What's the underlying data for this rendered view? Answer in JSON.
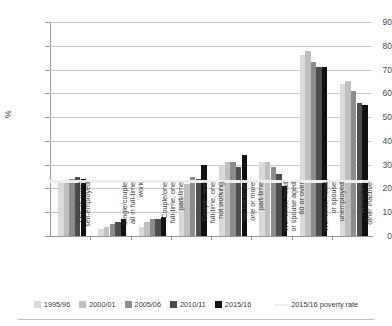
{
  "chart_data": {
    "type": "bar",
    "title": "",
    "subtitle": "",
    "xlabel": "",
    "ylabel": "%",
    "ylim": [
      0,
      90
    ],
    "yticks": [
      0,
      10,
      20,
      30,
      40,
      50,
      60,
      70,
      80,
      90
    ],
    "grid": true,
    "legend_position": "bottom",
    "categories": [
      "One or more\nself-employed",
      "Single/couple\nall in full-time\nwork",
      "Couple/one\nfull-time, one\npart-time",
      "Couple, one\nfull-time, one\nnot working",
      "No full-time,\none or more\npart-time",
      "Workless, head\nor spouse aged\n60 or over",
      "Workless, head\nor spouse\nunemployed",
      "Workless,\nother inactive"
    ],
    "series": [
      {
        "name": "1995/96",
        "color": "#d9d9d9",
        "values": [
          23,
          3,
          4,
          17,
          30,
          31,
          76,
          64
        ]
      },
      {
        "name": "2000/01",
        "color": "#bfbfbf",
        "values": [
          23,
          4,
          6,
          22,
          31,
          31,
          78,
          65
        ]
      },
      {
        "name": "2005/06",
        "color": "#8c8c8c",
        "values": [
          24,
          5,
          7,
          25,
          31,
          29,
          73,
          61
        ]
      },
      {
        "name": "2010/11",
        "color": "#4d4d4d",
        "values": [
          25,
          6,
          7,
          24,
          29,
          26,
          71,
          56
        ]
      },
      {
        "name": "2015/16",
        "color": "#111111",
        "values": [
          24,
          7,
          8,
          30,
          34,
          21,
          71,
          55
        ]
      }
    ],
    "reference_line": {
      "label": "2015/16 poverty rate",
      "value": 23,
      "color": "#eeeeee"
    }
  },
  "legend": {
    "items": [
      {
        "label": "1995/96",
        "color": "#d9d9d9",
        "kind": "swatch"
      },
      {
        "label": "2000/01",
        "color": "#bfbfbf",
        "kind": "swatch"
      },
      {
        "label": "2005/06",
        "color": "#8c8c8c",
        "kind": "swatch"
      },
      {
        "label": "2010/11",
        "color": "#4d4d4d",
        "kind": "swatch"
      },
      {
        "label": "2015/16",
        "color": "#111111",
        "kind": "swatch"
      },
      {
        "label": "2015/16 poverty rate",
        "color": "#eeeeee",
        "kind": "line"
      }
    ]
  },
  "axis": {
    "ylabel": "%",
    "ytick_labels": [
      "0",
      "10",
      "20",
      "30",
      "40",
      "50",
      "60",
      "70",
      "80",
      "90"
    ]
  }
}
